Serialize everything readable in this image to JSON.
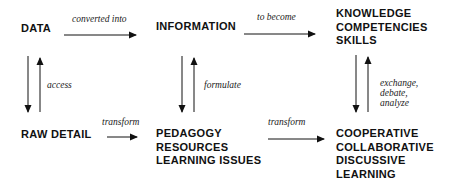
{
  "nodes": {
    "data": [
      "DATA"
    ],
    "information": [
      "INFORMATION"
    ],
    "knowledge": [
      "KNOWLEDGE",
      "COMPETENCIES",
      "SKILLS"
    ],
    "raw_detail": [
      "RAW DETAIL"
    ],
    "pedagogy": [
      "PEDAGOGY",
      "RESOURCES",
      "LEARNING ISSUES"
    ],
    "cooperative": [
      "COOPERATIVE",
      "COLLABORATIVE",
      "DISCUSSIVE",
      "LEARNING"
    ]
  },
  "edges": {
    "data_to_information": "converted into",
    "information_to_knowledge": "to become",
    "raw_to_data": "access",
    "pedagogy_to_information": "formulate",
    "cooperative_to_knowledge": [
      "exchange,",
      "debate,",
      "analyze"
    ],
    "raw_to_pedagogy": "transform",
    "pedagogy_to_cooperative": "transform"
  }
}
